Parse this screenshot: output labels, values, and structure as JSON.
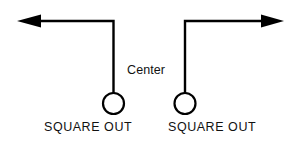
{
  "diagram": {
    "background_color": "#ffffff",
    "stroke_color": "#000000",
    "text_color": "#111111",
    "canvas": {
      "width": 297,
      "height": 143
    },
    "labels": {
      "center": "Center",
      "route_left": "SQUARE OUT",
      "route_right": "SQUARE OUT"
    },
    "players": [
      {
        "name": "left-receiver",
        "cx": 113.5,
        "cy": 103.5,
        "r": 10.5
      },
      {
        "name": "right-receiver",
        "cx": 185.0,
        "cy": 103.5,
        "r": 10.5
      }
    ],
    "routes": [
      {
        "name": "left-square-out",
        "direction": "left",
        "path": "M 113.5 93 L 113.5 21 L 41 21",
        "arrow_points": "17,21 41,14.5 41,27.5"
      },
      {
        "name": "right-square-out",
        "direction": "right",
        "path": "M 185 93 L 185 21 L 262 21",
        "arrow_points": "284,21 261,14.5 261,27.5"
      }
    ]
  }
}
